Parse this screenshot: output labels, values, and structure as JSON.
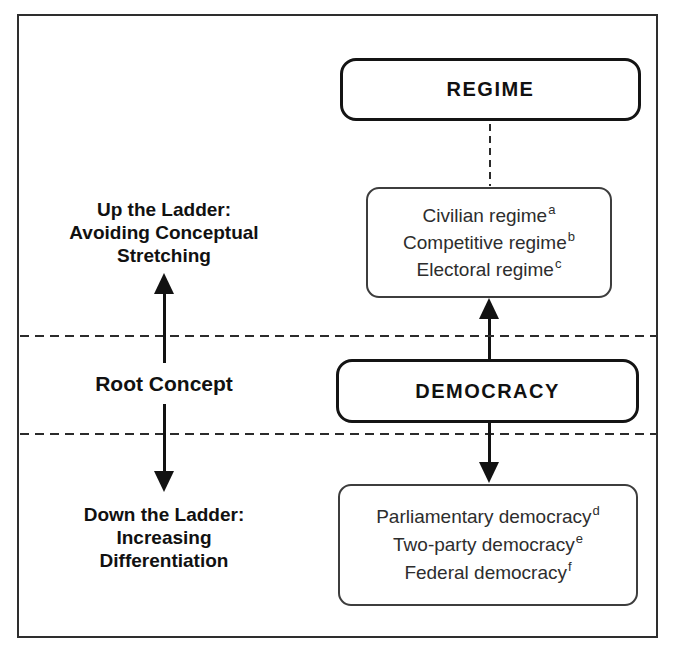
{
  "figure": {
    "regime_box": {
      "label": "REGIME"
    },
    "democracy_box": {
      "label": "DEMOCRACY"
    },
    "upper_variants": {
      "items": [
        {
          "text": "Civilian regime",
          "sup": "a"
        },
        {
          "text": "Competitive regime",
          "sup": "b"
        },
        {
          "text": "Electoral regime",
          "sup": "c"
        }
      ]
    },
    "lower_variants": {
      "items": [
        {
          "text": "Parliamentary democracy",
          "sup": "d"
        },
        {
          "text": "Two-party democracy",
          "sup": "e"
        },
        {
          "text": "Federal democracy",
          "sup": "f"
        }
      ]
    },
    "left_column": {
      "up_label": {
        "lines": [
          "Up the Ladder:",
          "Avoiding Conceptual",
          "Stretching"
        ]
      },
      "root_label": "Root Concept",
      "down_label": {
        "lines": [
          "Down the Ladder:",
          "Increasing",
          "Differentiation"
        ]
      }
    },
    "colors": {
      "ink": "#141414",
      "thin_border": "#3d3d3d",
      "background": "#ffffff"
    }
  }
}
